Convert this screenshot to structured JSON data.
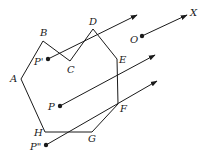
{
  "diagram": {
    "title": "",
    "colors": {
      "stroke": "#1a1a1a",
      "background": "#ffffff"
    },
    "polygon": {
      "vertices": [
        {
          "label": "A",
          "x": 21,
          "y": 79,
          "lx": 10,
          "ly": 82
        },
        {
          "label": "B",
          "x": 43,
          "y": 41,
          "lx": 40,
          "ly": 36
        },
        {
          "label": "C",
          "x": 70,
          "y": 61,
          "lx": 67,
          "ly": 73
        },
        {
          "label": "D",
          "x": 93,
          "y": 29,
          "lx": 89,
          "ly": 25
        },
        {
          "label": "E",
          "x": 117,
          "y": 59,
          "lx": 119,
          "ly": 63
        },
        {
          "label": "F",
          "x": 118,
          "y": 104,
          "lx": 120,
          "ly": 112
        },
        {
          "label": "G",
          "x": 92,
          "y": 132,
          "lx": 88,
          "ly": 142
        },
        {
          "label": "H",
          "x": 45,
          "y": 132,
          "lx": 34,
          "ly": 136
        }
      ]
    },
    "points": [
      {
        "label": "P'",
        "x": 48,
        "y": 59,
        "lx": 34,
        "ly": 65,
        "ray_end": {
          "x": 137,
          "y": 15
        }
      },
      {
        "label": "P",
        "x": 60,
        "y": 106,
        "lx": 48,
        "ly": 110,
        "ray_end": {
          "x": 155,
          "y": 55
        }
      },
      {
        "label": "P\"",
        "x": 46,
        "y": 145,
        "lx": 30,
        "ly": 150,
        "ray_end": {
          "x": 157,
          "y": 81
        }
      },
      {
        "label": "O",
        "x": 142,
        "y": 36,
        "lx": 130,
        "ly": 43,
        "ray_end": {
          "x": 187,
          "y": 15
        }
      }
    ],
    "ray_label": {
      "label": "X",
      "x": 190,
      "y": 16
    }
  }
}
